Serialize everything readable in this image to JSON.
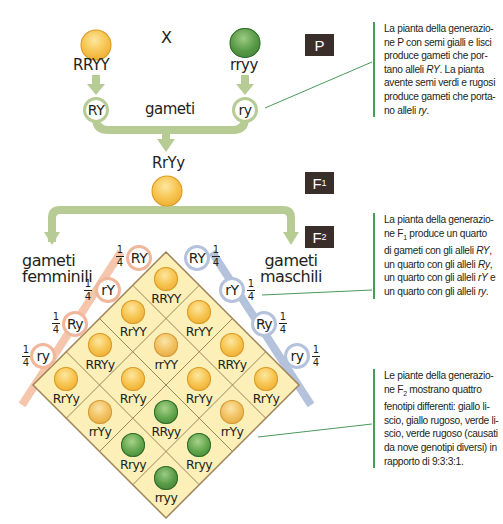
{
  "parental": {
    "cross_symbol": "X",
    "parent_left": {
      "genotype": "RRYY",
      "seed": "yellow-round-seed"
    },
    "parent_right": {
      "genotype": "rryy",
      "seed": "green-wrinkled-seed"
    },
    "gamete_left": "RY",
    "gamete_right": "ry",
    "gametes_label": "gameti"
  },
  "f1": {
    "genotype": "RrYy",
    "seed": "yellow-round-seed"
  },
  "badges": {
    "p": "P",
    "f1_letter": "F",
    "f1_sub": "1",
    "f2_letter": "F",
    "f2_sub": "2"
  },
  "f2": {
    "female_label_1": "gameti",
    "female_label_2": "femminili",
    "male_label_1": "gameti",
    "male_label_2": "maschili",
    "fraction_num": "1",
    "fraction_den": "4",
    "female_gametes": [
      "RY",
      "rY",
      "Ry",
      "ry"
    ],
    "male_gametes": [
      "RY",
      "rY",
      "Ry",
      "ry"
    ],
    "punnett_grid": [
      [
        "RRYY",
        "RrYY",
        "RRYy",
        "RrYy"
      ],
      [
        "RrYY",
        "rrYY",
        "RrYy",
        "rrYy"
      ],
      [
        "RRYy",
        "RrYy",
        "RRyy",
        "Rryy"
      ],
      [
        "RrYy",
        "rrYy",
        "Rryy",
        "rryy"
      ]
    ],
    "seed_types": [
      [
        "yellow-round",
        "yellow-round",
        "yellow-round",
        "yellow-round"
      ],
      [
        "yellow-round",
        "yellow-wrinkled",
        "yellow-round",
        "yellow-wrinkled"
      ],
      [
        "yellow-round",
        "yellow-round",
        "green-round",
        "green-round"
      ],
      [
        "yellow-round",
        "yellow-wrinkled",
        "green-round",
        "green-wrinkled"
      ]
    ]
  },
  "notes": {
    "p_note": {
      "line1": "La pianta della generazio-",
      "line2": "ne P con semi gialli e lisci",
      "line3": "produce gameti che por-",
      "line4a": "tano alleli ",
      "line4b": "RY",
      "line4c": ". La pianta",
      "line5": "avente semi verdi e rugosi",
      "line6": "produce gameti che porta-",
      "line7a": "no alleli ",
      "line7b": "ry",
      "line7c": "."
    },
    "f1_note": {
      "line1": "La pianta della generazio-",
      "line2a": "ne F",
      "line2sub": "1",
      "line2b": " produce un quarto",
      "line3a": "di gameti con gli alleli ",
      "line3b": "RY",
      "line3c": ",",
      "line4a": "un quarto con gli alleli ",
      "line4b": "Ry",
      "line4c": ",",
      "line5a": "un quarto con gli alleli ",
      "line5b": "rY",
      "line5c": " e",
      "line6a": "un quarto con gli alleli ",
      "line6b": "ry",
      "line6c": "."
    },
    "f2_note": {
      "line1": "Le piante della generazio-",
      "line2a": "ne F",
      "line2sub": "2",
      "line2b": " mostrano quattro",
      "line3": "fenotipi differenti: giallo li-",
      "line4": "scio, giallo rugoso, verde li-",
      "line5": "scio, verde rugoso (causati",
      "line6": "da nove genotipi diversi) in",
      "line7": "rapporto di 9:3:3:1."
    }
  },
  "colors": {
    "arrow_green": "#b7cc95",
    "female_orange": "#f0b79a",
    "male_blue": "#b5c2dc",
    "cell_fill": "#fcefb8",
    "cell_border": "#a08458",
    "badge_bg": "#3a2e2b",
    "note_line": "#4a9a5a"
  }
}
